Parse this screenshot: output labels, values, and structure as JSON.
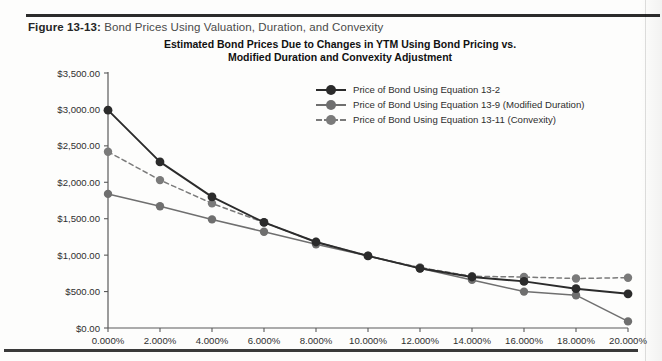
{
  "caption": {
    "label": "Figure 13-13:",
    "text": "Bond Prices Using Valuation, Duration, and Convexity"
  },
  "chart_data": {
    "type": "line",
    "title": "Estimated Bond Prices Due to Changes in YTM Using Bond Pricing vs. Modified Duration and Convexity Adjustment",
    "title_line1": "Estimated Bond Prices Due to Changes in YTM Using Bond Pricing vs.",
    "title_line2": "Modified Duration and Convexity Adjustment",
    "xlabel": "",
    "ylabel": "",
    "x": [
      0,
      2,
      4,
      6,
      8,
      10,
      12,
      14,
      16,
      18,
      20
    ],
    "categories": [
      "0.000%",
      "2.000%",
      "4.000%",
      "6.000%",
      "8.000%",
      "10.000%",
      "12.000%",
      "14.000%",
      "16.000%",
      "18.000%",
      "20.000%"
    ],
    "xtick_labels": [
      "0.000%",
      "2.000%",
      "4.000%",
      "6.000%",
      "8.000%",
      "10.000%",
      "12.000%",
      "14.000%",
      "16.000%",
      "18.000%",
      "20.000%"
    ],
    "ytick_labels": [
      "$0.00",
      "$500.00",
      "$1,000.00",
      "$1,500.00",
      "$2,000.00",
      "$2,500.00",
      "$3,000.00",
      "$3,500.00"
    ],
    "ytick_values": [
      0,
      500,
      1000,
      1500,
      2000,
      2500,
      3000,
      3500
    ],
    "ylim": [
      0,
      3500
    ],
    "xlim": [
      0,
      20
    ],
    "grid": false,
    "legend_position": "upper right inside",
    "series": [
      {
        "name": "Price of Bond Using Equation 13-2",
        "color": "#2b2b2b",
        "style": "solid",
        "marker": "circle",
        "values": [
          2990,
          2280,
          1800,
          1450,
          1180,
          990,
          820,
          700,
          640,
          540,
          470
        ]
      },
      {
        "name": "Price of Bond Using Equation 13-9 (Modified Duration)",
        "color": "#6f6f6f",
        "style": "solid",
        "marker": "circle",
        "values": [
          1840,
          1670,
          1490,
          1320,
          1150,
          990,
          820,
          660,
          500,
          450,
          90
        ]
      },
      {
        "name": "Price of Bond Using Equation 13-11 (Convexity)",
        "color": "#7a7a7a",
        "style": "dashed",
        "marker": "circle",
        "values": [
          2420,
          2030,
          1710,
          1450,
          1180,
          990,
          830,
          710,
          700,
          680,
          690
        ]
      }
    ]
  },
  "legend": {
    "items": [
      {
        "label": "Price of Bond Using Equation 13-2",
        "color": "#2b2b2b",
        "style": "solid"
      },
      {
        "label": "Price of Bond Using Equation 13-9 (Modified Duration)",
        "color": "#6f6f6f",
        "style": "solid"
      },
      {
        "label": "Price of Bond Using Equation 13-11 (Convexity)",
        "color": "#7a7a7a",
        "style": "dashed"
      }
    ]
  }
}
